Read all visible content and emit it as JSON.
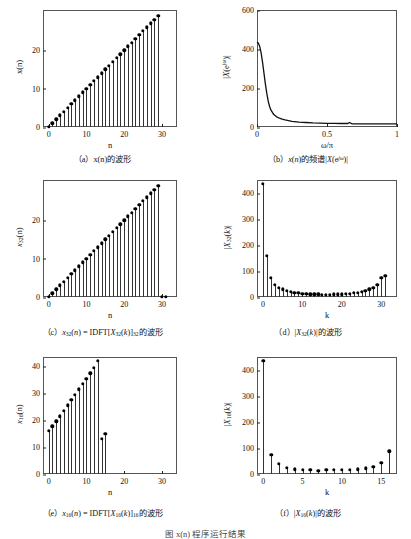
{
  "figure": {
    "bottom_caption": "图  x(n) 程序运行结果"
  },
  "panels": [
    {
      "id": "a",
      "caption": "（a）x(n)的波形",
      "xlabel": "n",
      "ylabel": "x(n)",
      "yticks": [
        "0",
        "10",
        "20"
      ],
      "xticks": [
        "0",
        "10",
        "20",
        "30"
      ]
    },
    {
      "id": "b",
      "caption": "（b）x(n)的频谱|X(e jω)|",
      "xlabel": "ω/π",
      "ylabel": "|X(e jω)|",
      "yticks": [
        "0",
        "200",
        "400",
        "600"
      ],
      "xticks": [
        "0",
        "0.5",
        "1"
      ]
    },
    {
      "id": "c",
      "caption": "（c）x32(n) = IDFT[X32(k)]32的波形",
      "xlabel": "n",
      "ylabel": "x32(n)",
      "yticks": [
        "0",
        "10",
        "20"
      ],
      "xticks": [
        "0",
        "10",
        "20",
        "30"
      ]
    },
    {
      "id": "d",
      "caption": "（d）|X32(k)|的波形",
      "xlabel": "k",
      "ylabel": "|X32(k)|",
      "yticks": [
        "0",
        "100",
        "200",
        "300",
        "400"
      ],
      "xticks": [
        "0",
        "10",
        "20",
        "30"
      ]
    },
    {
      "id": "e",
      "caption": "（e）x16(n) = IDFT[X16(k)]16的波形",
      "xlabel": "n",
      "ylabel": "x16(n)",
      "yticks": [
        "0",
        "10",
        "20",
        "30",
        "40"
      ],
      "xticks": [
        "0",
        "10",
        "20",
        "30"
      ]
    },
    {
      "id": "f",
      "caption": "（f）|X16(k)|的波形",
      "xlabel": "k",
      "ylabel": "|X16(k)|",
      "yticks": [
        "0",
        "100",
        "200",
        "300",
        "400"
      ],
      "xticks": [
        "0",
        "5",
        "10",
        "15"
      ]
    }
  ],
  "chart_data": [
    {
      "id": "a",
      "type": "line",
      "plot_style": "stem",
      "title": "x(n)的波形",
      "xlabel": "n",
      "ylabel": "x(n)",
      "xlim": [
        -1.5,
        34
      ],
      "ylim": [
        0,
        30.5
      ],
      "xticks": [
        0,
        10,
        20,
        30
      ],
      "yticks": [
        0,
        10,
        20
      ],
      "grid": false,
      "x": [
        0,
        1,
        2,
        3,
        4,
        5,
        6,
        7,
        8,
        9,
        10,
        11,
        12,
        13,
        14,
        15,
        16,
        17,
        18,
        19,
        20,
        21,
        22,
        23,
        24,
        25,
        26,
        27,
        28,
        29
      ],
      "values": [
        0,
        1,
        2,
        3,
        4,
        5,
        6,
        7,
        8,
        9,
        10,
        11,
        12,
        13,
        14,
        15,
        16,
        17,
        18,
        19,
        20,
        21,
        22,
        23,
        24,
        25,
        26,
        27,
        28,
        29
      ]
    },
    {
      "id": "b",
      "type": "line",
      "plot_style": "curve",
      "title": "x(n)的频谱|X(e jω)|",
      "xlabel": "ω/π",
      "ylabel": "|X(e jω)|",
      "xlim": [
        0,
        1
      ],
      "ylim": [
        0,
        600
      ],
      "xticks": [
        0,
        0.5,
        1
      ],
      "yticks": [
        0,
        200,
        400,
        600
      ],
      "grid": false,
      "x": [
        0,
        0.01,
        0.02,
        0.03,
        0.04,
        0.05,
        0.06,
        0.07,
        0.08,
        0.09,
        0.1,
        0.12,
        0.14,
        0.16,
        0.18,
        0.2,
        0.25,
        0.3,
        0.35,
        0.4,
        0.45,
        0.5,
        0.55,
        0.6,
        0.65,
        0.66,
        0.68,
        0.7,
        0.75,
        0.8,
        0.85,
        0.9,
        0.95,
        1.0
      ],
      "values": [
        435,
        430,
        412,
        378,
        330,
        275,
        220,
        172,
        133,
        105,
        86,
        64,
        52,
        45,
        40,
        36,
        29,
        25,
        23,
        21,
        20,
        19,
        19,
        18,
        18,
        23,
        16,
        16,
        16,
        16,
        16,
        16,
        16,
        16
      ]
    },
    {
      "id": "c",
      "type": "line",
      "plot_style": "stem",
      "title": "x32(n) = IDFT[X32(k)]32的波形",
      "xlabel": "n",
      "ylabel": "x32(n)",
      "xlim": [
        -1.5,
        34
      ],
      "ylim": [
        0,
        30.5
      ],
      "xticks": [
        0,
        10,
        20,
        30
      ],
      "yticks": [
        0,
        10,
        20
      ],
      "grid": false,
      "x": [
        0,
        1,
        2,
        3,
        4,
        5,
        6,
        7,
        8,
        9,
        10,
        11,
        12,
        13,
        14,
        15,
        16,
        17,
        18,
        19,
        20,
        21,
        22,
        23,
        24,
        25,
        26,
        27,
        28,
        29,
        30,
        31
      ],
      "values": [
        0,
        1,
        2,
        3,
        4,
        5,
        6,
        7,
        8,
        9,
        10,
        11,
        12,
        13,
        14,
        15,
        16,
        17,
        18,
        19,
        20,
        21,
        22,
        23,
        24,
        25,
        26,
        27,
        28,
        29,
        0,
        0
      ]
    },
    {
      "id": "d",
      "type": "line",
      "plot_style": "stem",
      "title": "|X32(k)|的波形",
      "xlabel": "k",
      "ylabel": "|X32(k)|",
      "xlim": [
        -1.5,
        34
      ],
      "ylim": [
        0,
        450
      ],
      "xticks": [
        0,
        10,
        20,
        30
      ],
      "yticks": [
        0,
        100,
        200,
        300,
        400
      ],
      "grid": false,
      "x": [
        0,
        1,
        2,
        3,
        4,
        5,
        6,
        7,
        8,
        9,
        10,
        11,
        12,
        13,
        14,
        15,
        16,
        17,
        18,
        19,
        20,
        21,
        22,
        23,
        24,
        25,
        26,
        27,
        28,
        29,
        30,
        31
      ],
      "values": [
        435,
        158,
        75,
        48,
        35,
        30,
        24,
        20,
        17,
        15,
        13,
        12,
        11,
        10,
        10,
        9,
        9,
        9,
        10,
        10,
        11,
        12,
        13,
        15,
        17,
        20,
        24,
        30,
        35,
        48,
        75,
        82
      ]
    },
    {
      "id": "e",
      "type": "line",
      "plot_style": "stem",
      "title": "x16(n) = IDFT[X16(k)]16的波形",
      "xlabel": "n",
      "ylabel": "x16(n)",
      "xlim": [
        -1.5,
        34
      ],
      "ylim": [
        0,
        43.5
      ],
      "xticks": [
        0,
        10,
        20,
        30
      ],
      "yticks": [
        0,
        10,
        20,
        30,
        40
      ],
      "grid": false,
      "x": [
        0,
        1,
        2,
        3,
        4,
        5,
        6,
        7,
        8,
        9,
        10,
        11,
        12,
        13,
        14,
        15
      ],
      "values": [
        16,
        17.8,
        19.6,
        21.5,
        23.5,
        25.5,
        27.5,
        29.5,
        31.5,
        33.5,
        35.5,
        37.5,
        39.5,
        42,
        13,
        15
      ]
    },
    {
      "id": "f",
      "type": "line",
      "plot_style": "stem",
      "title": "|X16(k)|的波形",
      "xlabel": "k",
      "ylabel": "|X16(k)|",
      "xlim": [
        -0.8,
        17
      ],
      "ylim": [
        0,
        450
      ],
      "xticks": [
        0,
        5,
        10,
        15
      ],
      "yticks": [
        0,
        100,
        200,
        300,
        400
      ],
      "grid": false,
      "x": [
        0,
        1,
        2,
        3,
        4,
        5,
        6,
        7,
        8,
        9,
        10,
        11,
        12,
        13,
        14,
        15,
        16
      ],
      "values": [
        435,
        75,
        40,
        25,
        18,
        15,
        15,
        12,
        15,
        15,
        15,
        15,
        18,
        22,
        28,
        42,
        88
      ]
    }
  ]
}
